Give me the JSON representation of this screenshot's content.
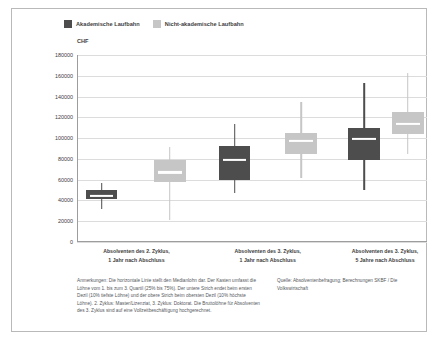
{
  "legend": {
    "entries": [
      {
        "label": "Akademische Laufbahn",
        "color": "#4d4d4d"
      },
      {
        "label": "Nicht-akademische Laufbahn",
        "color": "#c6c6c6"
      }
    ]
  },
  "footnotes": {
    "note": "Anmerkungen: Die horizontale Linie stellt den Medianlohn dar. Der Kasten umfasst die Löhne vom 1. bis zum 3. Quartil (25% bis 75%). Der untere Strich endet beim ersten Dezil (10% tiefste Löhne) und der obere Strich beim obersten Dezil (10% höchste Löhne). 2. Zyklus: Master/Lizenziat, 3. Zyklus: Doktorat. Die Bruttolöhne für Absolventen des 3. Zyklus sind auf eine Vollzeitbeschäftigung hochgerechnet.",
    "source": "Quelle: Absolventenbefragung; Berechnungen SKBF / Die Volkswirtschaft"
  },
  "chart_data": {
    "type": "boxplot",
    "title": "",
    "ylabel": "CHF",
    "xlabel": "",
    "ylim": [
      0,
      180000
    ],
    "ytick_step": 20000,
    "yticks": [
      180000,
      160000,
      140000,
      120000,
      100000,
      80000,
      60000,
      40000,
      20000,
      0
    ],
    "ytick_labels": [
      "180000",
      "160000",
      "140000",
      "120000",
      "100000",
      "80000",
      "60000",
      "40000",
      "20000",
      "0"
    ],
    "grid": true,
    "legend_position": "top-left",
    "categories": [
      "Absolventen des 2. Zyklus,\n1 Jahr nach Abschluss",
      "Absolventen des 3. Zyklus,\n1 Jahr nach Abschluss",
      "Absolventen des 3. Zyklus,\n5 Jahre nach Abschluss"
    ],
    "category_lines": [
      [
        "Absolventen des 2. Zyklus,",
        "1 Jahr nach Abschluss"
      ],
      [
        "Absolventen des 3. Zyklus,",
        "1 Jahr nach Abschluss"
      ],
      [
        "Absolventen des 3. Zyklus,",
        "5 Jahre nach Abschluss"
      ]
    ],
    "series": [
      {
        "name": "Akademische Laufbahn",
        "color": "#4d4d4d",
        "boxes": [
          {
            "category": "Absolventen des 2. Zyklus, 1 Jahr nach Abschluss",
            "d10": 57000,
            "q1": 50000,
            "median": 44000,
            "q3": 41000,
            "d90": 32000
          },
          {
            "category": "Absolventen des 3. Zyklus, 1 Jahr nach Abschluss",
            "d10": 114000,
            "q1": 92000,
            "median": 79000,
            "q3": 60000,
            "d90": 47000
          },
          {
            "category": "Absolventen des 3. Zyklus, 5 Jahre nach Abschluss",
            "d10": 153000,
            "q1": 110000,
            "median": 99000,
            "q3": 79000,
            "d90": 50000
          }
        ]
      },
      {
        "name": "Nicht-akademische Laufbahn",
        "color": "#c6c6c6",
        "boxes": [
          {
            "category": "Absolventen des 2. Zyklus, 1 Jahr nach Abschluss",
            "d10": 91000,
            "q1": 79000,
            "median": 67000,
            "q3": 58000,
            "d90": 21000
          },
          {
            "category": "Absolventen des 3. Zyklus, 1 Jahr nach Abschluss",
            "d10": 135000,
            "q1": 105000,
            "median": 97000,
            "q3": 85000,
            "d90": 62000
          },
          {
            "category": "Absolventen des 3. Zyklus, 5 Jahre nach Abschluss",
            "d10": 163000,
            "q1": 125000,
            "median": 114000,
            "q3": 104000,
            "d90": 85000
          }
        ]
      }
    ],
    "box_layout": [
      {
        "name": "akademisch-2zyklus-1jahr",
        "series": 0,
        "group": 0,
        "center_pct": 7.0,
        "width_pct": 9.0,
        "lower": 41000,
        "q1": 41000,
        "median": 44000,
        "q3": 50000,
        "upper": 57000,
        "whisker_low": 32000
      },
      {
        "name": "nichtakademisch-2zyklus-1jahr",
        "series": 1,
        "group": 0,
        "center_pct": 26.5,
        "width_pct": 9.0,
        "lower": 58000,
        "q1": 58000,
        "median": 67000,
        "q3": 79000,
        "upper": 91000,
        "whisker_low": 21000
      },
      {
        "name": "akademisch-3zyklus-1jahr",
        "series": 0,
        "group": 1,
        "center_pct": 45.0,
        "width_pct": 9.0,
        "lower": 60000,
        "q1": 60000,
        "median": 79000,
        "q3": 92000,
        "upper": 114000,
        "whisker_low": 47000
      },
      {
        "name": "nichtakademisch-3zyklus-1jahr",
        "series": 1,
        "group": 1,
        "center_pct": 64.0,
        "width_pct": 9.0,
        "lower": 85000,
        "q1": 85000,
        "median": 97000,
        "q3": 105000,
        "upper": 135000,
        "whisker_low": 62000
      },
      {
        "name": "akademisch-3zyklus-5jahre",
        "series": 0,
        "group": 2,
        "center_pct": 82.0,
        "width_pct": 9.0,
        "lower": 79000,
        "q1": 79000,
        "median": 99000,
        "q3": 110000,
        "upper": 153000,
        "whisker_low": 50000
      },
      {
        "name": "nichtakademisch-3zyklus-5jahre",
        "series": 1,
        "group": 2,
        "center_pct": 94.5,
        "width_pct": 9.0,
        "lower": 104000,
        "q1": 104000,
        "median": 114000,
        "q3": 125000,
        "upper": 163000,
        "whisker_low": 85000
      }
    ],
    "group_label_centers_pct": [
      17,
      54.5,
      88
    ]
  }
}
